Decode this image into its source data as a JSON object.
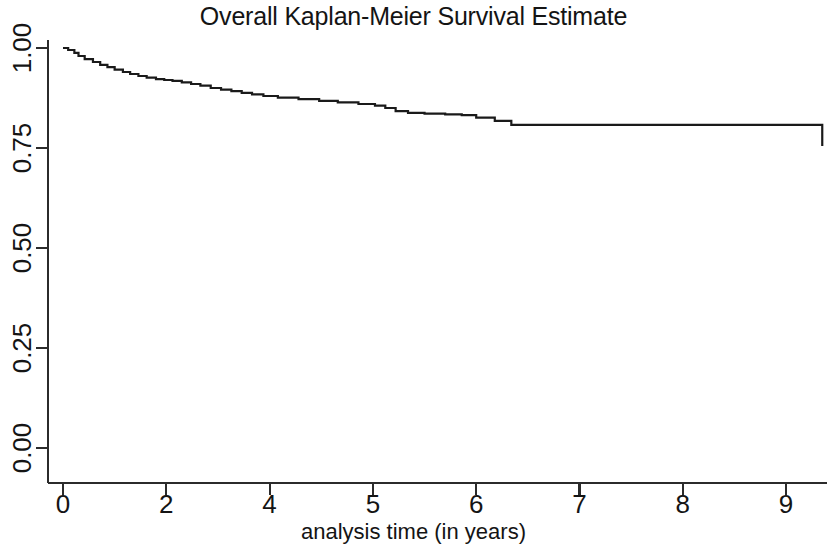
{
  "chart_data": {
    "type": "line",
    "subtype": "kaplan-meier-step",
    "title": "Overall Kaplan-Meier Survival Estimate",
    "xlabel": "analysis time (in years)",
    "ylabel": "",
    "xlim": [
      -0.12,
      9.4
    ],
    "ylim": [
      0.0,
      1.0
    ],
    "grid": false,
    "legend": null,
    "xticks": [
      0,
      2,
      4,
      5,
      6,
      7,
      8,
      9
    ],
    "xtick_labels": [
      "0",
      "2",
      "4",
      "5",
      "6",
      "7",
      "8",
      "9"
    ],
    "yticks": [
      0.0,
      0.25,
      0.5,
      0.75,
      1.0
    ],
    "ytick_labels": [
      "0.00",
      "0.25",
      "0.50",
      "0.75",
      "1.00"
    ],
    "line_color": "#1a1a1a",
    "line_width": 2.2,
    "series": [
      {
        "name": "Overall survival",
        "step": "post",
        "x": [
          0.0,
          0.1,
          0.22,
          0.3,
          0.42,
          0.58,
          0.72,
          0.86,
          1.0,
          1.16,
          1.3,
          1.46,
          1.62,
          1.8,
          1.96,
          2.12,
          2.3,
          2.48,
          2.66,
          2.86,
          3.06,
          3.26,
          3.46,
          3.66,
          3.88,
          4.08,
          4.28,
          4.48,
          4.66,
          4.86,
          5.02,
          5.12,
          5.22,
          5.34,
          5.5,
          5.7,
          5.86,
          6.0,
          6.18,
          6.34,
          7.85,
          9.35
        ],
        "y": [
          1.0,
          0.995,
          0.988,
          0.98,
          0.972,
          0.965,
          0.958,
          0.952,
          0.946,
          0.94,
          0.935,
          0.93,
          0.926,
          0.922,
          0.92,
          0.918,
          0.914,
          0.91,
          0.906,
          0.9,
          0.896,
          0.892,
          0.888,
          0.884,
          0.88,
          0.876,
          0.872,
          0.868,
          0.864,
          0.86,
          0.856,
          0.85,
          0.842,
          0.838,
          0.836,
          0.834,
          0.832,
          0.826,
          0.818,
          0.808,
          0.808,
          0.755
        ]
      }
    ],
    "annotations": [
      {
        "label": "long plateau before final drop",
        "x_range": [
          6.34,
          7.85
        ],
        "y": 0.808
      },
      {
        "label": "final survival probability",
        "x_range": [
          7.85,
          9.35
        ],
        "y": 0.755
      }
    ]
  },
  "axes": {
    "title": "Overall Kaplan-Meier Survival Estimate",
    "x_axis_title": "analysis time (in years)"
  }
}
